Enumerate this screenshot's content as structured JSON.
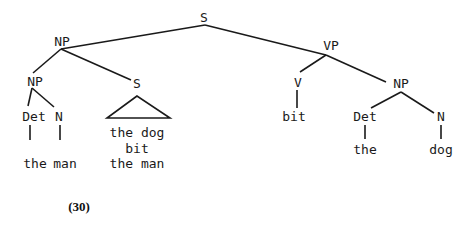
{
  "diagram": {
    "type": "syntax-tree",
    "caption": "(30)",
    "nodes": {
      "root_s": "S",
      "np_top": "NP",
      "vp": "VP",
      "np_left": "NP",
      "s_embedded": "S",
      "det_left": "Det",
      "n_left": "N",
      "v": "V",
      "np_right": "NP",
      "det_right": "Det",
      "n_right": "N"
    },
    "leaves": {
      "the_left": "the",
      "man_left": "man",
      "embedded_line1": "the dog",
      "embedded_line2": "bit",
      "embedded_line3": "the man",
      "bit": "bit",
      "the_right": "the",
      "dog_right": "dog"
    }
  }
}
